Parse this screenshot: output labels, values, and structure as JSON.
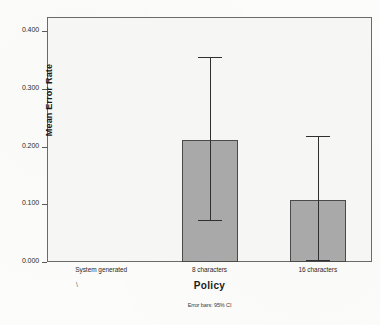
{
  "chart_data": {
    "type": "bar",
    "title": "",
    "xlabel": "Policy",
    "ylabel": "Mean Error Rate",
    "categories": [
      "System generated",
      "8 characters",
      "16 characters"
    ],
    "values": [
      0.0,
      0.212,
      0.108
    ],
    "error_low": [
      0.0,
      0.073,
      0.003
    ],
    "error_high": [
      0.0,
      0.355,
      0.218
    ],
    "ylim": [
      0.0,
      0.42
    ],
    "yticks": [
      "0.000",
      "0.100",
      "0.200",
      "0.300",
      "0.400"
    ],
    "ytick_values": [
      0.0,
      0.1,
      0.2,
      0.3,
      0.4
    ],
    "grid": false,
    "legend": "none",
    "footnote": "Error bars: 95% CI",
    "bar_color": "#a9a9a9",
    "bar_border_color": "#4a4a4a",
    "error_bar_color": "#303030",
    "plot_background": "#f6f6f4",
    "axis_color": "#6a6a6a"
  },
  "annotations": {
    "stray_mark": "\\"
  }
}
